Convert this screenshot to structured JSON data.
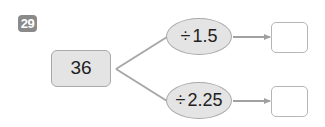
{
  "problem": {
    "number": "29",
    "start_value": "36",
    "branches": [
      {
        "operator": "÷",
        "operand": "1.5",
        "answer": ""
      },
      {
        "operator": "÷",
        "operand": "2.25",
        "answer": ""
      }
    ]
  },
  "colors": {
    "badge_bg": "#8a8a8a",
    "box_fill": "#e4e4e4",
    "border": "#a9a9a9",
    "line": "#a0a0a0"
  }
}
